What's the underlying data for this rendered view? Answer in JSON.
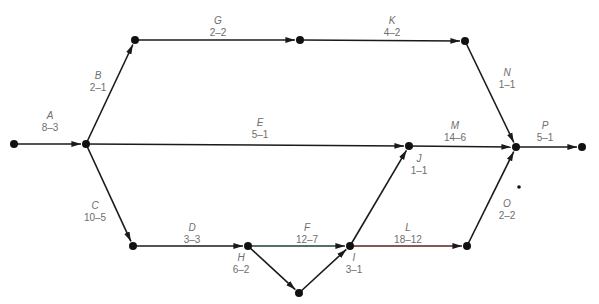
{
  "diagram": {
    "type": "activity-on-arrow network (PERT/CPM)",
    "nodes": [
      {
        "id": "n1",
        "x": 14,
        "y": 144
      },
      {
        "id": "n2",
        "x": 86,
        "y": 144
      },
      {
        "id": "n3",
        "x": 135,
        "y": 40
      },
      {
        "id": "n4",
        "x": 300,
        "y": 40
      },
      {
        "id": "n5",
        "x": 465,
        "y": 41
      },
      {
        "id": "n6",
        "x": 133,
        "y": 246
      },
      {
        "id": "n7",
        "x": 248,
        "y": 246
      },
      {
        "id": "n8",
        "x": 299,
        "y": 293
      },
      {
        "id": "n9",
        "x": 350,
        "y": 246
      },
      {
        "id": "n10",
        "x": 409,
        "y": 146
      },
      {
        "id": "n11",
        "x": 467,
        "y": 246
      },
      {
        "id": "n12",
        "x": 516,
        "y": 147
      },
      {
        "id": "n13",
        "x": 582,
        "y": 147
      },
      {
        "id": "stray-dot",
        "x": 519,
        "y": 187,
        "small": true
      }
    ],
    "activities": [
      {
        "name": "A",
        "duration": "8-3",
        "from": "n1",
        "to": "n2",
        "label_x": 50,
        "label_y": 110
      },
      {
        "name": "B",
        "duration": "2-1",
        "from": "n2",
        "to": "n3",
        "label_x": 98,
        "label_y": 70
      },
      {
        "name": "G",
        "duration": "2-2",
        "from": "n3",
        "to": "n4",
        "label_x": 218,
        "label_y": 15
      },
      {
        "name": "K",
        "duration": "4-2",
        "from": "n4",
        "to": "n5",
        "label_x": 392,
        "label_y": 15
      },
      {
        "name": "N",
        "duration": "1-1",
        "from": "n5",
        "to": "n12",
        "label_x": 507,
        "label_y": 67
      },
      {
        "name": "E",
        "duration": "5-1",
        "from": "n2",
        "to": "n10",
        "label_x": 260,
        "label_y": 117
      },
      {
        "name": "M",
        "duration": "14-6",
        "from": "n10",
        "to": "n12",
        "label_x": 455,
        "label_y": 120
      },
      {
        "name": "P",
        "duration": "5-1",
        "from": "n12",
        "to": "n13",
        "label_x": 545,
        "label_y": 120
      },
      {
        "name": "C",
        "duration": "10-5",
        "from": "n2",
        "to": "n6",
        "label_x": 95,
        "label_y": 200
      },
      {
        "name": "D",
        "duration": "3-3",
        "from": "n6",
        "to": "n7",
        "label_x": 192,
        "label_y": 222
      },
      {
        "name": "H",
        "duration": "6-2",
        "from": "n7",
        "to": "n8",
        "label_x": 241,
        "label_y": 252
      },
      {
        "name": "F",
        "duration": "12-7",
        "from": "n7",
        "to": "n9",
        "label_x": 307,
        "label_y": 222
      },
      {
        "name": "I",
        "duration": "3-1",
        "from": "n8",
        "to": "n9",
        "label_x": 354,
        "label_y": 252
      },
      {
        "name": "J",
        "duration": "1-1",
        "from": "n9",
        "to": "n10",
        "label_x": 419,
        "label_y": 153
      },
      {
        "name": "L",
        "duration": "18-12",
        "from": "n9",
        "to": "n11",
        "label_x": 408,
        "label_y": 222
      },
      {
        "name": "O",
        "duration": "2-2",
        "from": "n11",
        "to": "n12",
        "label_x": 507,
        "label_y": 198
      }
    ]
  },
  "colors": {
    "edge": "#1a1a1a",
    "node": "#111111",
    "label": "#6e6e6e",
    "edge_F_tint": "#1f3f3a",
    "edge_L_tint": "#5a2020"
  }
}
